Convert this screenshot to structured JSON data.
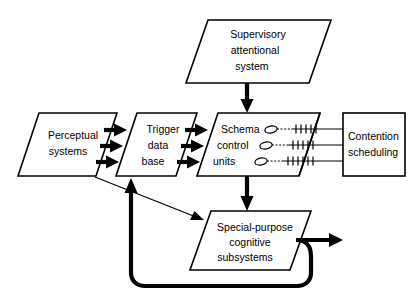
{
  "diagram": {
    "nodes": {
      "supervisory": {
        "id": "supervisory-attentional-system",
        "shape": "parallelogram",
        "lines": [
          "Supervisory",
          "attentional",
          "system"
        ]
      },
      "perceptual": {
        "id": "perceptual-systems",
        "shape": "parallelogram",
        "lines": [
          "Perceptual",
          "systems"
        ]
      },
      "trigger": {
        "id": "trigger-data-base",
        "shape": "parallelogram",
        "lines": [
          "Trigger",
          "data",
          "base"
        ]
      },
      "schema": {
        "id": "schema-control-units",
        "shape": "parallelogram",
        "lines": [
          "Schema",
          "control",
          "units"
        ]
      },
      "contention": {
        "id": "contention-scheduling",
        "shape": "rectangle",
        "lines": [
          "Contention",
          "scheduling"
        ]
      },
      "special": {
        "id": "special-purpose-cognitive-subsystems",
        "shape": "parallelogram",
        "lines": [
          "Special-purpose",
          "cognitive",
          "subsystems"
        ]
      }
    },
    "connections": [
      {
        "id": "supervisory-to-schema",
        "from": "supervisory",
        "to": "schema",
        "style": "thick-arrow"
      },
      {
        "id": "perceptual-to-trigger",
        "from": "perceptual",
        "to": "trigger",
        "style": "thick-arrow",
        "count": 3
      },
      {
        "id": "trigger-to-schema",
        "from": "trigger",
        "to": "schema",
        "style": "thick-arrow",
        "count": 3
      },
      {
        "id": "schema-to-contention",
        "from": "schema",
        "to": "contention",
        "style": "oval-dashed-rail",
        "count": 3
      },
      {
        "id": "schema-to-special",
        "from": "schema",
        "to": "special",
        "style": "thick-arrow"
      },
      {
        "id": "perceptual-to-special",
        "from": "perceptual",
        "to": "special",
        "style": "thin-arrow"
      },
      {
        "id": "special-feedback-to-trigger",
        "from": "special",
        "to": "trigger",
        "style": "thick-loop-arrow"
      },
      {
        "id": "special-output",
        "from": "special",
        "to": "output",
        "style": "thick-arrow"
      }
    ],
    "colors": {
      "stroke": "#000000",
      "fill": "#ffffff",
      "background": "#ffffff"
    }
  }
}
